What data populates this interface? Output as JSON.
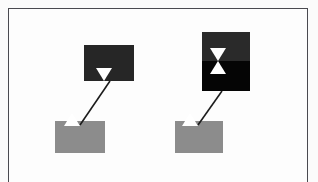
{
  "figure": {
    "title": "",
    "background_color": "#fbfbfb",
    "frame_color": "#4a4a50",
    "frame": {
      "x": 8,
      "y": 8,
      "width": 300,
      "height": 190,
      "bottom_open": true
    }
  },
  "palette": {
    "white": "#ffffff",
    "grey_block": "#8c8c8c",
    "dark_block": "#262626",
    "dark_block_top": "#2a2a2a",
    "black_block": "#050505",
    "connector": "#1c1c1c",
    "paper": "#fdfdfd"
  },
  "blocks": [
    {
      "id": "left-target-block",
      "label": "",
      "kind": "dark",
      "color": "#262626",
      "x": 84,
      "y": 45,
      "width": 50,
      "height": 36
    },
    {
      "id": "right-target-block-upper",
      "label": "",
      "kind": "dark",
      "color": "#2a2a2a",
      "x": 202,
      "y": 32,
      "width": 48,
      "height": 29
    },
    {
      "id": "right-target-block-lower",
      "label": "",
      "kind": "black",
      "color": "#050505",
      "x": 202,
      "y": 61,
      "width": 48,
      "height": 30
    },
    {
      "id": "left-source-block",
      "label": "",
      "kind": "grey",
      "color": "#8c8c8c",
      "x": 55,
      "y": 121,
      "width": 50,
      "height": 32
    },
    {
      "id": "right-source-block",
      "label": "",
      "kind": "grey",
      "color": "#8c8c8c",
      "x": 175,
      "y": 121,
      "width": 48,
      "height": 32
    }
  ],
  "markers": [
    {
      "id": "left-target-marker",
      "shape": "triangle-down",
      "color": "#ffffff",
      "x": 104,
      "y": 68
    },
    {
      "id": "right-target-marker-down",
      "shape": "triangle-down",
      "color": "#ffffff",
      "x": 218,
      "y": 48
    },
    {
      "id": "right-target-marker-up",
      "shape": "triangle-up",
      "color": "#ffffff",
      "x": 218,
      "y": 61
    },
    {
      "id": "left-source-marker",
      "shape": "triangle-up",
      "color": "#ffffff",
      "x": 72,
      "y": 113
    },
    {
      "id": "right-source-marker",
      "shape": "triangle-up",
      "color": "#ffffff",
      "x": 190,
      "y": 113
    }
  ],
  "connectors": [
    {
      "id": "left-connector",
      "from_block": "left-source-block",
      "to_block": "left-target-block",
      "x1": 80,
      "y1": 125,
      "x2": 110,
      "y2": 81,
      "color": "#1c1c1c",
      "width": 1.6
    },
    {
      "id": "right-connector",
      "from_block": "right-source-block",
      "to_block": "right-target-block-lower",
      "x1": 198,
      "y1": 125,
      "x2": 222,
      "y2": 91,
      "color": "#1c1c1c",
      "width": 1.6
    }
  ]
}
